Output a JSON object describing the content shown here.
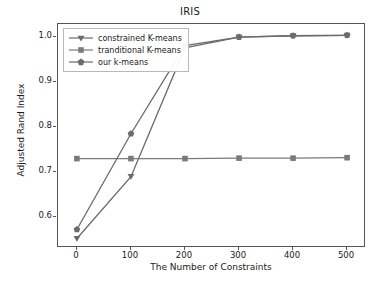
{
  "chart_data": {
    "type": "line",
    "title": "IRIS",
    "xlabel": "The Number of Constraints",
    "ylabel": "Adjusted Rand Index",
    "x": [
      0,
      100,
      200,
      300,
      400,
      500
    ],
    "xlim": [
      -35,
      535
    ],
    "ylim": [
      0.532,
      1.028
    ],
    "xticks": [
      0,
      100,
      200,
      300,
      400,
      500
    ],
    "xtick_labels": [
      "0",
      "100",
      "200",
      "300",
      "400",
      "500"
    ],
    "yticks": [
      0.6,
      0.7,
      0.8,
      0.9,
      1.0
    ],
    "ytick_labels": [
      "0.6",
      "0.7",
      "0.8",
      "0.9",
      "1.0"
    ],
    "grid": false,
    "legend_position": "upper left",
    "series": [
      {
        "name": "constrained K-means",
        "marker": "triangle-down",
        "color": "#6b6b6b",
        "values": [
          0.553,
          0.69,
          0.975,
          0.999,
          1.002,
          1.003
        ]
      },
      {
        "name": "tranditional K-means",
        "marker": "square",
        "color": "#7a7a7a",
        "values": [
          0.73,
          0.73,
          0.73,
          0.731,
          0.731,
          0.732
        ]
      },
      {
        "name": "our k-means",
        "marker": "pentagon",
        "color": "#6b6b6b",
        "values": [
          0.573,
          0.785,
          0.98,
          0.999,
          1.002,
          1.003
        ]
      }
    ]
  },
  "axes": {
    "spine_color": "#555555"
  },
  "legend": {
    "items": [
      {
        "label": "constrained K-means"
      },
      {
        "label": "tranditional K-means"
      },
      {
        "label": "our k-means"
      }
    ]
  }
}
